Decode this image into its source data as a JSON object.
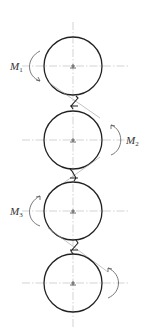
{
  "diagram": {
    "type": "rotor-chain-schematic",
    "colors": {
      "circle": "#222222",
      "axis": "#b5b5b5",
      "arrow": "#555555",
      "label": "#333333"
    },
    "rollers": [
      {
        "id": 1,
        "cx": 73,
        "cy": 66,
        "r": 29,
        "moment_label": "M",
        "moment_sub": "1",
        "moment_side": "left"
      },
      {
        "id": 2,
        "cx": 73,
        "cy": 140,
        "r": 29,
        "moment_label": "M",
        "moment_sub": "2",
        "moment_side": "right"
      },
      {
        "id": 3,
        "cx": 73,
        "cy": 211,
        "r": 29,
        "moment_label": "M",
        "moment_sub": "3",
        "moment_side": "left"
      },
      {
        "id": 4,
        "cx": 73,
        "cy": 283,
        "r": 29,
        "moment_label": "",
        "moment_sub": "",
        "moment_side": "right"
      }
    ],
    "labels": {
      "m1": "M",
      "m1_sub": "1",
      "m2": "M",
      "m2_sub": "2",
      "m3": "M",
      "m3_sub": "3"
    }
  }
}
